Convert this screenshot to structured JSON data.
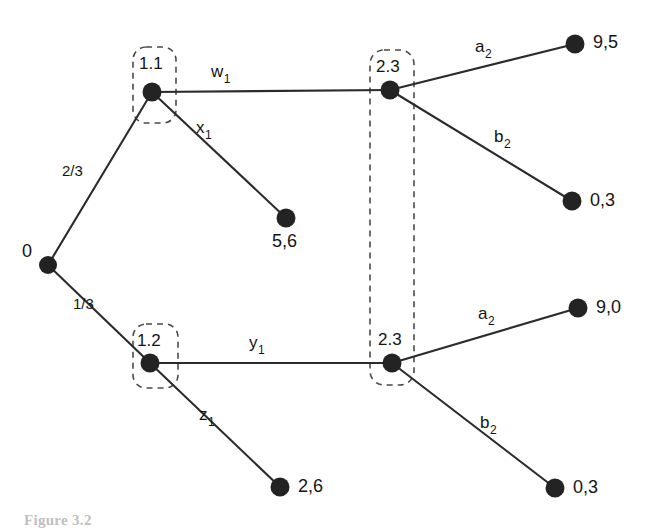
{
  "figure": {
    "caption": "Figure 3.2",
    "type": "extensive-form-game-tree"
  },
  "colors": {
    "node": "#232323",
    "edge": "#2b2b2b",
    "infoset": "#4a4a4a",
    "background": "#ffffff"
  },
  "nodes": {
    "root": {
      "label": "0"
    },
    "player1_upper": {
      "label": "1.1"
    },
    "player1_lower": {
      "label": "1.2"
    },
    "player2_upper": {
      "label": "2.3"
    },
    "player2_lower": {
      "label": "2.3"
    }
  },
  "chance_probabilities": {
    "upper": "2/3",
    "lower": "1/3"
  },
  "actions": {
    "upper_across": {
      "base": "w",
      "sub": "1"
    },
    "upper_down": {
      "base": "x",
      "sub": "1"
    },
    "lower_across": {
      "base": "y",
      "sub": "1"
    },
    "lower_down": {
      "base": "z",
      "sub": "1"
    },
    "upper_a": {
      "base": "a",
      "sub": "2"
    },
    "upper_b": {
      "base": "b",
      "sub": "2"
    },
    "lower_a": {
      "base": "a",
      "sub": "2"
    },
    "lower_b": {
      "base": "b",
      "sub": "2"
    }
  },
  "payoffs": {
    "x1_terminal": "5,6",
    "upper_a2_terminal": "9,5",
    "upper_b2_terminal": "0,3",
    "z1_terminal": "2,6",
    "lower_a2_terminal": "9,0",
    "lower_b2_terminal": "0,3"
  }
}
